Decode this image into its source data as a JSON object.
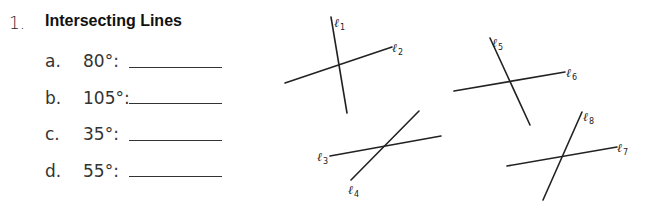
{
  "problem": {
    "number": "1.",
    "title": "Intersecting Lines",
    "items": [
      {
        "letter": "a.",
        "angle": "80°:",
        "answer": ""
      },
      {
        "letter": "b.",
        "angle": "105°:",
        "answer": ""
      },
      {
        "letter": "c.",
        "angle": "35°:",
        "answer": ""
      },
      {
        "letter": "d.",
        "angle": "55°:",
        "answer": ""
      }
    ]
  },
  "figure": {
    "line_color": "#222222",
    "lines": [
      {
        "name": "l1",
        "label": "ℓ",
        "sub": "1"
      },
      {
        "name": "l2",
        "label": "ℓ",
        "sub": "2"
      },
      {
        "name": "l3",
        "label": "ℓ",
        "sub": "3"
      },
      {
        "name": "l4",
        "label": "ℓ",
        "sub": "4"
      },
      {
        "name": "l5",
        "label": "ℓ",
        "sub": "5"
      },
      {
        "name": "l6",
        "label": "ℓ",
        "sub": "6"
      },
      {
        "name": "l7",
        "label": "ℓ",
        "sub": "7"
      },
      {
        "name": "l8",
        "label": "ℓ",
        "sub": "8"
      }
    ]
  }
}
